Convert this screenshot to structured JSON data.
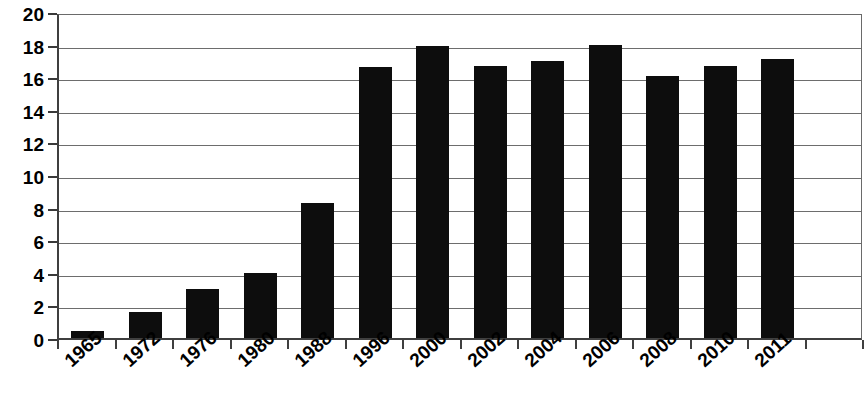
{
  "chart_data": {
    "type": "bar",
    "title": "",
    "subtitle": "",
    "xlabel": "",
    "ylabel": "",
    "categories": [
      "1965",
      "1972",
      "1976",
      "1980",
      "1988",
      "1996",
      "2000",
      "2002",
      "2004",
      "2006",
      "2008",
      "2010",
      "2011"
    ],
    "values": [
      0.4,
      1.6,
      3.0,
      4.0,
      8.3,
      16.6,
      17.9,
      16.7,
      17.0,
      18.0,
      16.1,
      16.7,
      17.1
    ],
    "series": [
      {
        "name": "",
        "values": [
          0.4,
          1.6,
          3.0,
          4.0,
          8.3,
          16.6,
          17.9,
          16.7,
          17.0,
          18.0,
          16.1,
          16.7,
          17.1
        ]
      }
    ],
    "ylim": [
      0,
      20
    ],
    "ytick_step": 2,
    "ytick_labels": [
      "0",
      "2",
      "4",
      "6",
      "8",
      "10",
      "12",
      "14",
      "16",
      "18",
      "20"
    ],
    "xtick_labels": [
      "1965",
      "1972",
      "1976",
      "1980",
      "1988",
      "1996",
      "2000",
      "2002",
      "2004",
      "2006",
      "2008",
      "2010",
      "2011"
    ],
    "xtick_label_rotation_deg": -42,
    "grid": {
      "horizontal": true,
      "vertical": false
    },
    "legend": {
      "visible": false,
      "position": "none",
      "entries": []
    },
    "bar_color": "#0d0d0d",
    "gridline_color": "#6d6d6d",
    "axis_color": "#3f3f3f",
    "background_color": "#ffffff",
    "category_slots": 14,
    "empty_trailing_slots": 1,
    "annotations": []
  }
}
